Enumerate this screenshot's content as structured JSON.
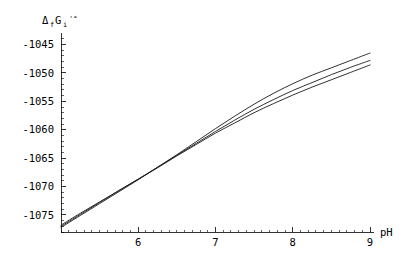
{
  "chart_data": {
    "type": "line",
    "title": "",
    "xlabel": "pH",
    "ylabel": "ΔfGi'°",
    "ylabel_parts": {
      "delta": "Δ",
      "sub_f": "f",
      "g": "G",
      "sub_i": "i",
      "prime_degree": "'°"
    },
    "xlim": [
      5.0,
      9.0
    ],
    "ylim": [
      -1078.0,
      -1043.5
    ],
    "xticks": [
      6,
      7,
      8,
      9
    ],
    "xtick_labels": [
      "6",
      "7",
      "8",
      "9"
    ],
    "yticks": [
      -1045,
      -1050,
      -1055,
      -1060,
      -1065,
      -1070,
      -1075
    ],
    "ytick_labels": [
      "-1045",
      "-1050",
      "-1055",
      "-1060",
      "-1065",
      "-1070",
      "-1075"
    ],
    "xminor_step": 0.1,
    "yminor_step": 1,
    "grid": false,
    "legend": null,
    "frame": false,
    "series": [
      {
        "name": "curve-1",
        "x": [
          5.0,
          5.25,
          5.5,
          5.75,
          6.0,
          6.25,
          6.5,
          6.75,
          7.0,
          7.25,
          7.5,
          7.75,
          8.0,
          8.25,
          8.5,
          8.75,
          9.0
        ],
        "values": [
          -1077.2,
          -1075.1,
          -1073.0,
          -1070.9,
          -1068.8,
          -1066.6,
          -1064.4,
          -1062.1,
          -1059.8,
          -1057.6,
          -1055.5,
          -1053.6,
          -1051.9,
          -1050.4,
          -1049.1,
          -1047.8,
          -1046.5
        ]
      },
      {
        "name": "curve-2",
        "x": [
          5.0,
          5.25,
          5.5,
          5.75,
          6.0,
          6.25,
          6.5,
          6.75,
          7.0,
          7.25,
          7.5,
          7.75,
          8.0,
          8.25,
          8.5,
          8.75,
          9.0
        ],
        "values": [
          -1077.0,
          -1074.9,
          -1072.8,
          -1070.7,
          -1068.7,
          -1066.6,
          -1064.5,
          -1062.4,
          -1060.3,
          -1058.3,
          -1056.4,
          -1054.7,
          -1053.1,
          -1051.7,
          -1050.3,
          -1049.0,
          -1047.8
        ]
      },
      {
        "name": "curve-3",
        "x": [
          5.0,
          5.25,
          5.5,
          5.75,
          6.0,
          6.25,
          6.5,
          6.75,
          7.0,
          7.25,
          7.5,
          7.75,
          8.0,
          8.25,
          8.5,
          8.75,
          9.0
        ],
        "values": [
          -1076.8,
          -1074.7,
          -1072.7,
          -1070.7,
          -1068.7,
          -1066.7,
          -1064.6,
          -1062.6,
          -1060.6,
          -1058.8,
          -1057.0,
          -1055.4,
          -1053.9,
          -1052.5,
          -1051.2,
          -1049.9,
          -1048.6
        ]
      }
    ]
  },
  "plot_geometry": {
    "x_axis_pixel_left": 61,
    "x_axis_pixel_right": 370,
    "x_axis_pixel_y": 232,
    "y_axis_pixel_x": 61,
    "y_axis_pixel_top": 36,
    "y_axis_pixel_bottom": 232
  }
}
